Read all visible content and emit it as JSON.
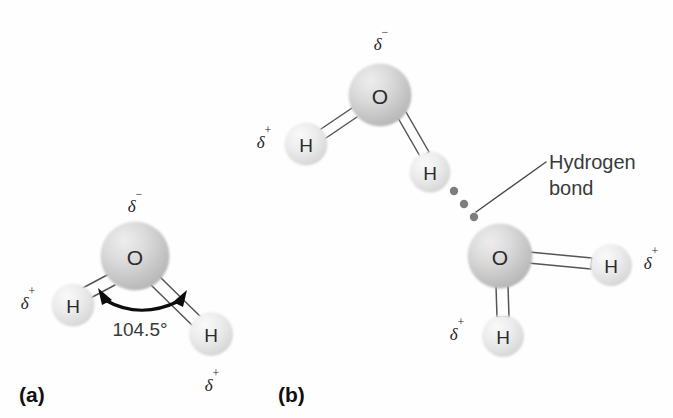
{
  "figure": {
    "background_color": "#fefefe",
    "atom_text_color": "#2b2b2b",
    "bond_color": "#555555",
    "sphere_oxygen_color": "#c9c9c9",
    "sphere_hydrogen_color": "#e0e0e0",
    "dot_color": "#7d7d7d"
  },
  "panels": [
    {
      "id": "a",
      "label": "(a)",
      "description": "Single water molecule showing partial charges and bond angle"
    },
    {
      "id": "b",
      "label": "(b)",
      "description": "Two water molecules joined by a hydrogen bond"
    }
  ],
  "panel_a": {
    "label": "(a)",
    "oxygen": {
      "symbol": "O",
      "charge": "δ",
      "charge_sign": "−",
      "cx": 135,
      "cy": 256,
      "r": 34
    },
    "hydrogen_left": {
      "symbol": "H",
      "charge": "δ",
      "charge_sign": "+",
      "cx": 73,
      "cy": 305,
      "r": 21
    },
    "hydrogen_right": {
      "symbol": "H",
      "charge": "δ",
      "charge_sign": "+",
      "cx": 211,
      "cy": 334,
      "r": 22
    },
    "angle": {
      "value": "104.5°",
      "numeric": 104.5
    }
  },
  "panel_b": {
    "label": "(b)",
    "callout": {
      "line1": "Hydrogen",
      "line2": "bond"
    },
    "molecule_top": {
      "oxygen": {
        "symbol": "O",
        "charge": "δ",
        "charge_sign": "−",
        "cx": 380,
        "cy": 95,
        "r": 31
      },
      "hydrogen_left": {
        "symbol": "H",
        "charge": "δ",
        "charge_sign": "+",
        "cx": 306,
        "cy": 144,
        "r": 21
      },
      "hydrogen_lower": {
        "symbol": "H",
        "charge": "",
        "charge_sign": "",
        "cx": 430,
        "cy": 172,
        "r": 20
      }
    },
    "molecule_bottom": {
      "oxygen": {
        "symbol": "O",
        "charge": "",
        "charge_sign": "",
        "cx": 500,
        "cy": 256,
        "r": 32
      },
      "hydrogen_right": {
        "symbol": "H",
        "charge": "δ",
        "charge_sign": "+",
        "cx": 611,
        "cy": 265,
        "r": 21
      },
      "hydrogen_bottom": {
        "symbol": "H",
        "charge": "δ",
        "charge_sign": "+",
        "cx": 503,
        "cy": 336,
        "r": 21
      }
    },
    "hydrogen_bond_dots": [
      {
        "cx": 454,
        "cy": 191,
        "r": 4.2
      },
      {
        "cx": 464,
        "cy": 204,
        "r": 4.2
      },
      {
        "cx": 474,
        "cy": 217,
        "r": 4.2
      }
    ]
  }
}
